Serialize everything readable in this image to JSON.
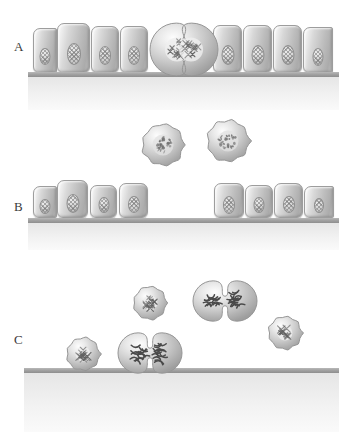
{
  "figure": {
    "width": 339,
    "height": 432,
    "background_color": "#ffffff",
    "description_type": "three-panel cell biology diagram of epithelial mitosis and cell rounding"
  },
  "colors": {
    "substrate": "#a2a2a2",
    "cell_fill_light": "#f0f0f0",
    "cell_fill_mid": "#c8c8c8",
    "cell_fill_dark": "#a8a8a8",
    "cell_outline": "#9d9d9d",
    "nucleus_fill": "#cfcfcf",
    "chromosome": "#5a5a5a",
    "label_text": "#3b3b3b",
    "background": "#ffffff"
  },
  "panels": [
    {
      "id": "panel-a",
      "label": "A",
      "label_x": 14,
      "label_y": 39,
      "top": 0,
      "height": 110,
      "substrate": {
        "x": 28,
        "y": 72,
        "width": 311,
        "height": 5
      },
      "substrate_shadow": {
        "x": 28,
        "y": 77,
        "width": 311,
        "height": 33
      },
      "epithelial_cells": [
        {
          "x": 33,
          "y": 28,
          "width": 24,
          "height": 45,
          "partial": true,
          "nucleus_top": 19,
          "nucleus_w": 11,
          "nucleus_h": 17
        },
        {
          "x": 57,
          "y": 23,
          "width": 33,
          "height": 50,
          "partial": false,
          "nucleus_top": 19,
          "nucleus_w": 14,
          "nucleus_h": 22
        },
        {
          "x": 91,
          "y": 26,
          "width": 28,
          "height": 47,
          "partial": false,
          "nucleus_top": 19,
          "nucleus_w": 12,
          "nucleus_h": 19
        },
        {
          "x": 120,
          "y": 26,
          "width": 28,
          "height": 47,
          "partial": false,
          "nucleus_top": 19,
          "nucleus_w": 12,
          "nucleus_h": 19
        },
        {
          "x": 213,
          "y": 25,
          "width": 29,
          "height": 48,
          "partial": false,
          "nucleus_top": 19,
          "nucleus_w": 13,
          "nucleus_h": 20
        },
        {
          "x": 243,
          "y": 25,
          "width": 29,
          "height": 48,
          "partial": false,
          "nucleus_top": 19,
          "nucleus_w": 13,
          "nucleus_h": 20
        },
        {
          "x": 273,
          "y": 25,
          "width": 29,
          "height": 48,
          "partial": false,
          "nucleus_top": 19,
          "nucleus_w": 13,
          "nucleus_h": 20
        },
        {
          "x": 303,
          "y": 27,
          "width": 30,
          "height": 46,
          "partial": true,
          "nucleus_top": 20,
          "nucleus_w": 11,
          "nucleus_h": 18
        }
      ],
      "dividing_cells": [
        {
          "x": 147,
          "y": 20,
          "width": 70,
          "height": 55,
          "chromatin_style": "condensed-clump"
        }
      ],
      "rounded_cells": []
    },
    {
      "id": "panel-b",
      "label": "B",
      "label_x": 14,
      "label_y": 199,
      "top": 110,
      "height": 140,
      "substrate": {
        "x": 28,
        "y": 218,
        "width": 311,
        "height": 5
      },
      "substrate_shadow": {
        "x": 28,
        "y": 223,
        "width": 311,
        "height": 27
      },
      "epithelial_cells": [
        {
          "x": 33,
          "y": 186,
          "width": 24,
          "height": 32,
          "partial": true,
          "nucleus_top": 12,
          "nucleus_w": 11,
          "nucleus_h": 15
        },
        {
          "x": 57,
          "y": 180,
          "width": 31,
          "height": 38,
          "partial": false,
          "nucleus_top": 13,
          "nucleus_w": 13,
          "nucleus_h": 19
        },
        {
          "x": 90,
          "y": 185,
          "width": 27,
          "height": 33,
          "partial": false,
          "nucleus_top": 11,
          "nucleus_w": 11,
          "nucleus_h": 16
        },
        {
          "x": 119,
          "y": 183,
          "width": 29,
          "height": 35,
          "partial": false,
          "nucleus_top": 12,
          "nucleus_w": 12,
          "nucleus_h": 17
        },
        {
          "x": 214,
          "y": 183,
          "width": 30,
          "height": 35,
          "partial": false,
          "nucleus_top": 12,
          "nucleus_w": 12,
          "nucleus_h": 18
        },
        {
          "x": 245,
          "y": 185,
          "width": 28,
          "height": 33,
          "partial": false,
          "nucleus_top": 11,
          "nucleus_w": 11,
          "nucleus_h": 16
        },
        {
          "x": 274,
          "y": 183,
          "width": 29,
          "height": 35,
          "partial": false,
          "nucleus_top": 12,
          "nucleus_w": 12,
          "nucleus_h": 17
        },
        {
          "x": 304,
          "y": 186,
          "width": 30,
          "height": 32,
          "partial": true,
          "nucleus_top": 11,
          "nucleus_w": 10,
          "nucleus_h": 15
        }
      ],
      "dividing_cells": [],
      "rounded_cells": [
        {
          "x": 136,
          "y": 118,
          "size": 48,
          "chromatin_style": "scattered"
        },
        {
          "x": 201,
          "y": 114,
          "size": 48,
          "chromatin_style": "scattered"
        }
      ]
    },
    {
      "id": "panel-c",
      "label": "C",
      "label_x": 14,
      "label_y": 332,
      "top": 250,
      "height": 182,
      "substrate": {
        "x": 24,
        "y": 368,
        "width": 315,
        "height": 5
      },
      "substrate_shadow": {
        "x": 24,
        "y": 373,
        "width": 315,
        "height": 59
      },
      "epithelial_cells": [],
      "dividing_cells": [
        {
          "x": 190,
          "y": 278,
          "width": 66,
          "height": 42,
          "chromatin_style": "x-chromosomes"
        },
        {
          "x": 115,
          "y": 330,
          "width": 66,
          "height": 42,
          "chromatin_style": "x-chromosomes"
        }
      ],
      "rounded_cells": [
        {
          "x": 128,
          "y": 281,
          "size": 38,
          "chromatin_style": "clump"
        },
        {
          "x": 263,
          "y": 311,
          "size": 38,
          "chromatin_style": "clump"
        },
        {
          "x": 61,
          "y": 332,
          "size": 38,
          "chromatin_style": "clump"
        }
      ]
    }
  ]
}
